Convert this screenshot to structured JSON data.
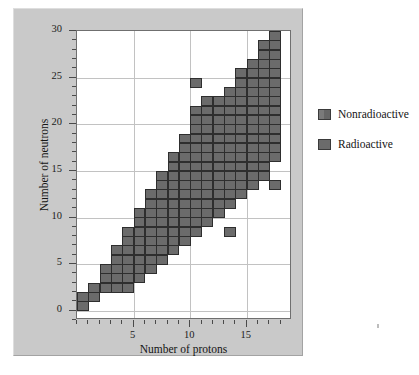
{
  "figure": {
    "panel_bg": "#c9c9c9",
    "plot_bg": "#ffffff",
    "cell_color": "#6b6b6b",
    "cell_border": "#2e2e2e",
    "grid_color": "#c2c2c2"
  },
  "legend": {
    "position": "right",
    "items": [
      {
        "label": "Nonradioactive",
        "color": "#6b6b6b",
        "swatch": "nonradioactive-swatch"
      },
      {
        "label": "Radioactive",
        "color": "#6b6b6b",
        "swatch": "radioactive-swatch"
      }
    ]
  },
  "chart_data": {
    "type": "heatmap",
    "title": "",
    "subtitle": "",
    "xlabel": "Number of protons",
    "ylabel": "Number of neutrons",
    "xlim": [
      0,
      19
    ],
    "ylim": [
      -1,
      30
    ],
    "grid": true,
    "legend_position": "right",
    "x_major_ticks": [
      5,
      10,
      15
    ],
    "x_major_tick_labels": [
      "5",
      "10",
      "15"
    ],
    "x_minor_tick_step": 1,
    "y_major_ticks": [
      0,
      5,
      10,
      15,
      20,
      25,
      30
    ],
    "y_major_tick_labels": [
      "0",
      "5",
      "10",
      "15",
      "20",
      "25",
      "30"
    ],
    "y_minor_tick_step": 1,
    "cell_marks": "filled square = stable/known nuclide",
    "columns_note": "For each proton number (x), the list gives neutron numbers (y) of filled cells.",
    "columns": [
      {
        "protons": 1,
        "neutrons": [
          0,
          1
        ]
      },
      {
        "protons": 2,
        "neutrons": [
          1,
          2
        ]
      },
      {
        "protons": 3,
        "neutrons": [
          2,
          3,
          4
        ]
      },
      {
        "protons": 4,
        "neutrons": [
          2,
          3,
          4,
          5,
          6
        ]
      },
      {
        "protons": 5,
        "neutrons": [
          2,
          3,
          4,
          5,
          6,
          7,
          8
        ]
      },
      {
        "protons": 6,
        "neutrons": [
          3,
          4,
          5,
          6,
          7,
          8,
          9,
          10
        ]
      },
      {
        "protons": 7,
        "neutrons": [
          4,
          5,
          6,
          7,
          8,
          9,
          10,
          11,
          12
        ]
      },
      {
        "protons": 8,
        "neutrons": [
          5,
          6,
          7,
          8,
          9,
          10,
          11,
          12,
          13,
          14
        ]
      },
      {
        "protons": 9,
        "neutrons": [
          6,
          7,
          8,
          9,
          10,
          11,
          12,
          13,
          14,
          15,
          16
        ]
      },
      {
        "protons": 10,
        "neutrons": [
          7,
          8,
          9,
          10,
          11,
          12,
          13,
          14,
          15,
          16,
          17,
          18
        ]
      },
      {
        "protons": 11,
        "neutrons": [
          8,
          9,
          10,
          11,
          12,
          13,
          14,
          15,
          16,
          17,
          18,
          19,
          20,
          21,
          24
        ]
      },
      {
        "protons": 12,
        "neutrons": [
          9,
          10,
          11,
          12,
          13,
          14,
          15,
          16,
          17,
          18,
          19,
          20,
          21,
          22
        ]
      },
      {
        "protons": 13,
        "neutrons": [
          10,
          11,
          12,
          13,
          14,
          15,
          16,
          17,
          18,
          19,
          20,
          21,
          22
        ]
      },
      {
        "protons": 14,
        "neutrons": [
          8,
          11,
          12,
          13,
          14,
          15,
          16,
          17,
          18,
          19,
          20,
          21,
          22,
          23
        ]
      },
      {
        "protons": 15,
        "neutrons": [
          12,
          13,
          14,
          15,
          16,
          17,
          18,
          19,
          20,
          21,
          22,
          23,
          24,
          25
        ]
      },
      {
        "protons": 16,
        "neutrons": [
          13,
          14,
          15,
          16,
          17,
          18,
          19,
          20,
          21,
          22,
          23,
          24,
          25,
          26
        ]
      },
      {
        "protons": 17,
        "neutrons": [
          14,
          15,
          16,
          17,
          18,
          19,
          20,
          21,
          22,
          23,
          24,
          25,
          26,
          27,
          28
        ]
      },
      {
        "protons": 18,
        "neutrons": [
          13,
          16,
          17,
          18,
          19,
          20,
          21,
          22,
          23,
          24,
          25,
          26,
          27,
          28,
          29
        ]
      }
    ]
  }
}
